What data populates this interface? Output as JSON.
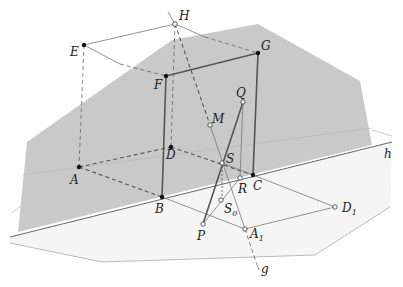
{
  "diagram": {
    "colors": {
      "plane_main": "#c8c8c8",
      "plane_ground": "#f4f4f4",
      "edge_dark": "#555555",
      "edge_light": "#888888",
      "point": "#111111"
    },
    "points": [
      {
        "name": "H",
        "x": 175,
        "y": 24,
        "style": "open"
      },
      {
        "name": "E",
        "x": 84,
        "y": 45,
        "style": "filled"
      },
      {
        "name": "G",
        "x": 258,
        "y": 53,
        "style": "filled"
      },
      {
        "name": "F",
        "x": 166,
        "y": 76,
        "style": "filled"
      },
      {
        "name": "Q",
        "x": 243,
        "y": 102,
        "style": "open"
      },
      {
        "name": "M",
        "x": 210,
        "y": 125,
        "style": "open"
      },
      {
        "name": "D",
        "x": 171,
        "y": 147,
        "style": "filled"
      },
      {
        "name": "A",
        "x": 79,
        "y": 167,
        "style": "filled"
      },
      {
        "name": "S",
        "x": 222,
        "y": 163,
        "style": "open"
      },
      {
        "name": "C",
        "x": 253,
        "y": 175,
        "style": "filled"
      },
      {
        "name": "R",
        "x": 240,
        "y": 178,
        "style": "open"
      },
      {
        "name": "B",
        "x": 162,
        "y": 197,
        "style": "filled"
      },
      {
        "name": "S0",
        "x": 221,
        "y": 200,
        "style": "open"
      },
      {
        "name": "D1",
        "x": 335,
        "y": 207,
        "style": "open"
      },
      {
        "name": "P",
        "x": 203,
        "y": 224,
        "style": "open"
      },
      {
        "name": "A1",
        "x": 245,
        "y": 229,
        "style": "open"
      }
    ],
    "labels": {
      "H": "H",
      "E": "E",
      "G": "G",
      "F": "F",
      "Q": "Q",
      "M": "M",
      "D": "D",
      "A": "A",
      "S": "S",
      "C": "C",
      "R": "R",
      "B": "B",
      "S0_main": "S",
      "S0_sub": "0",
      "D1_main": "D",
      "D1_sub": "1",
      "P": "P",
      "A1_main": "A",
      "A1_sub": "1",
      "g": "g",
      "h": "h"
    }
  }
}
